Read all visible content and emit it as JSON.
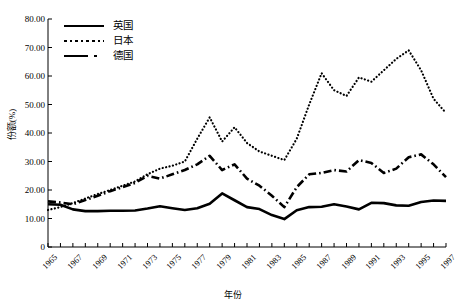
{
  "chart_data": {
    "type": "line",
    "title": "",
    "xlabel": "年份",
    "ylabel": "份额(%)",
    "xlim": [
      1965,
      1997
    ],
    "ylim": [
      0,
      80
    ],
    "ytick_labels": [
      "0",
      "10.00",
      "20.00",
      "30.00",
      "40.00",
      "50.00",
      "60.00",
      "70.00",
      "80.00"
    ],
    "ytick_values": [
      0,
      10,
      20,
      30,
      40,
      50,
      60,
      70,
      80
    ],
    "ytick_step": 10,
    "grid": false,
    "legend_position": "top-left",
    "x": [
      1965,
      1966,
      1967,
      1968,
      1969,
      1970,
      1971,
      1972,
      1973,
      1974,
      1975,
      1976,
      1977,
      1978,
      1979,
      1980,
      1981,
      1982,
      1983,
      1984,
      1985,
      1986,
      1987,
      1988,
      1989,
      1990,
      1991,
      1992,
      1993,
      1994,
      1995,
      1996,
      1997
    ],
    "xtick_labels": [
      "1965",
      "1967",
      "1969",
      "1971",
      "1973",
      "1975",
      "1977",
      "1979",
      "1981",
      "1983",
      "1985",
      "1987",
      "1989",
      "1991",
      "1993",
      "1995",
      "1997"
    ],
    "series": [
      {
        "name": "英国",
        "style": "solid",
        "values": [
          15.0,
          14.8,
          13.2,
          12.6,
          12.6,
          12.7,
          12.7,
          12.8,
          13.5,
          14.3,
          13.6,
          13.0,
          13.6,
          15.2,
          18.8,
          16.4,
          14.0,
          13.3,
          11.2,
          9.8,
          12.9,
          14.0,
          14.1,
          15.0,
          14.2,
          13.2,
          15.5,
          15.4,
          14.6,
          14.5,
          15.8,
          16.3,
          16.2
        ]
      },
      {
        "name": "日本",
        "style": "dotted",
        "values": [
          13.0,
          14.0,
          15.4,
          17.0,
          18.6,
          20.0,
          21.5,
          23.0,
          25.5,
          27.5,
          28.5,
          30.0,
          38.0,
          45.5,
          37.0,
          42.0,
          36.5,
          33.5,
          32.0,
          30.5,
          38.0,
          50.0,
          61.0,
          55.0,
          53.0,
          59.5,
          58.0,
          62.0,
          66.0,
          69.0,
          62.0,
          52.0,
          47.0
        ]
      },
      {
        "name": "德国",
        "style": "dashdot",
        "values": [
          16.0,
          15.6,
          15.0,
          16.5,
          18.0,
          19.6,
          21.0,
          22.5,
          25.0,
          24.0,
          25.5,
          27.0,
          29.0,
          32.0,
          27.0,
          29.0,
          24.0,
          21.5,
          18.0,
          14.0,
          21.0,
          25.5,
          26.0,
          27.0,
          26.5,
          30.5,
          29.5,
          26.0,
          27.5,
          31.5,
          32.5,
          29.0,
          24.5
        ]
      }
    ]
  },
  "legend": {
    "items": [
      {
        "label": "英国",
        "style": "solid"
      },
      {
        "label": "日本",
        "style": "dotted"
      },
      {
        "label": "德国",
        "style": "dashdot"
      }
    ]
  },
  "axes": {
    "y_label": "份额(%)",
    "x_label": "年份"
  }
}
